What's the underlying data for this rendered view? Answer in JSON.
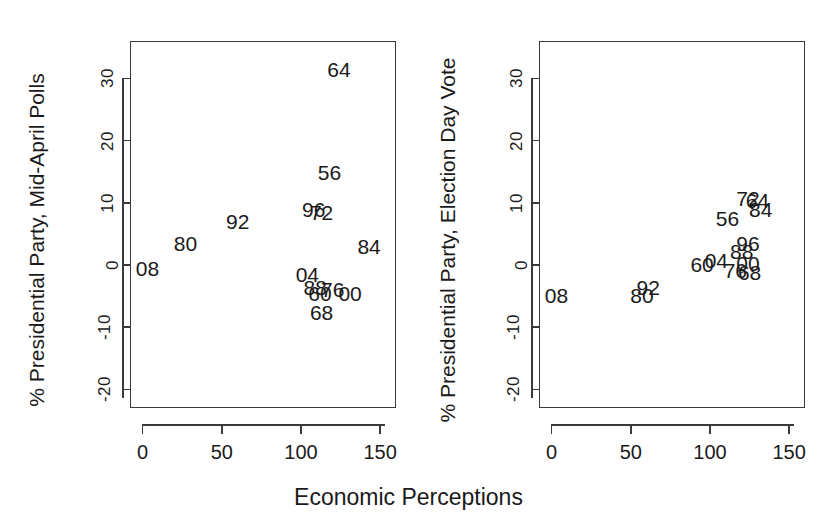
{
  "figure": {
    "xlabel": "Economic Perceptions",
    "width": 817,
    "height": 529,
    "background": "#ffffff",
    "ink_color": "#1a1a1a"
  },
  "panels": [
    {
      "id": "left",
      "ylabel": "% Presidential Party, Mid-April Polls",
      "xticks": [
        "0",
        "50",
        "100",
        "150"
      ],
      "yticks": [
        "30",
        "20",
        "10",
        "0",
        "-10",
        "-20"
      ]
    },
    {
      "id": "right",
      "ylabel": "% Presidential Party, Election Day Vote",
      "xticks": [
        "0",
        "50",
        "100",
        "150"
      ],
      "yticks": [
        "30",
        "20",
        "10",
        "0",
        "-10",
        "-20"
      ]
    }
  ],
  "chart_data": [
    {
      "type": "scatter",
      "panel": "left",
      "title": "",
      "xlabel": "Economic Perceptions",
      "ylabel": "% Presidential Party, Mid-April Polls",
      "xlim": [
        -8,
        160
      ],
      "ylim": [
        -23,
        36
      ],
      "xticks": [
        0,
        50,
        100,
        150
      ],
      "yticks": [
        30,
        20,
        10,
        0,
        -10,
        -20
      ],
      "grid": false,
      "legend": "none",
      "marker": "text-label",
      "points": [
        {
          "label": "64",
          "x": 124,
          "y": 31.5
        },
        {
          "label": "56",
          "x": 118,
          "y": 15.0
        },
        {
          "label": "96",
          "x": 108,
          "y": 9.0
        },
        {
          "label": "72",
          "x": 113,
          "y": 8.5
        },
        {
          "label": "92",
          "x": 60,
          "y": 7.0
        },
        {
          "label": "80",
          "x": 27,
          "y": 3.5
        },
        {
          "label": "84",
          "x": 143,
          "y": 3.0
        },
        {
          "label": "08",
          "x": 3,
          "y": -0.5
        },
        {
          "label": "04",
          "x": 104,
          "y": -1.5
        },
        {
          "label": "88",
          "x": 109,
          "y": -3.5
        },
        {
          "label": "60",
          "x": 112,
          "y": -4.5
        },
        {
          "label": "76",
          "x": 120,
          "y": -3.8
        },
        {
          "label": "00",
          "x": 131,
          "y": -4.5
        },
        {
          "label": "68",
          "x": 113,
          "y": -7.5
        }
      ]
    },
    {
      "type": "scatter",
      "panel": "right",
      "title": "",
      "xlabel": "Economic Perceptions",
      "ylabel": "% Presidential Party, Election Day Vote",
      "xlim": [
        -8,
        160
      ],
      "ylim": [
        -23,
        36
      ],
      "xticks": [
        0,
        50,
        100,
        150
      ],
      "yticks": [
        30,
        20,
        10,
        0,
        -10,
        -20
      ],
      "grid": false,
      "legend": "none",
      "marker": "text-label",
      "points": [
        {
          "label": "72",
          "x": 124,
          "y": 10.8
        },
        {
          "label": "64",
          "x": 130,
          "y": 10.5
        },
        {
          "label": "84",
          "x": 132,
          "y": 9.0
        },
        {
          "label": "56",
          "x": 111,
          "y": 7.5
        },
        {
          "label": "96",
          "x": 124,
          "y": 3.5
        },
        {
          "label": "88",
          "x": 120,
          "y": 2.2
        },
        {
          "label": "60",
          "x": 95,
          "y": 0.2
        },
        {
          "label": "04",
          "x": 104,
          "y": 0.8
        },
        {
          "label": "00",
          "x": 124,
          "y": 0.3
        },
        {
          "label": "76",
          "x": 116,
          "y": -0.8
        },
        {
          "label": "68",
          "x": 125,
          "y": -1.2
        },
        {
          "label": "92",
          "x": 61,
          "y": -3.5
        },
        {
          "label": "80",
          "x": 57,
          "y": -4.8
        },
        {
          "label": "08",
          "x": 3,
          "y": -4.8
        }
      ]
    }
  ]
}
